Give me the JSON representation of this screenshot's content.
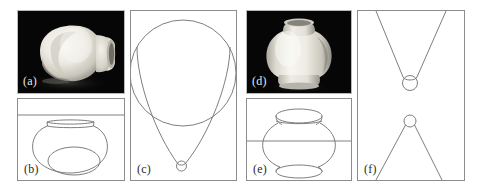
{
  "figure": {
    "background_color": "#ffffff",
    "line_color": "#6f6f6f",
    "photo_background": "#050505",
    "width": 482,
    "height": 189
  },
  "panels": [
    {
      "id": "a",
      "label": "(a)",
      "kind": "photograph",
      "label_color": "#e8e8e8",
      "description": "Greyscale photograph of a ceramic vase viewed obliquely from above, tilted on its side against a black background",
      "box": {
        "x": 17,
        "y": 10,
        "w": 108,
        "h": 84
      }
    },
    {
      "id": "b",
      "label": "(b)",
      "kind": "line-drawing",
      "label_color": "#2a2a2a",
      "description": "Line drawing of the tilted vase: rim ellipse seen nearly edge-on at top, rounded body, and an interior ellipse marking the base; a horizontal reference line crosses the upper part of the panel",
      "has_horizon_line": true,
      "box": {
        "x": 17,
        "y": 98,
        "w": 108,
        "h": 83
      }
    },
    {
      "id": "c",
      "label": "(c)",
      "kind": "construction",
      "label_color": "#2a2a2a",
      "description": "Projective construction for the tilted vase: a large circle clipped by the top of the frame, with two long tangent curves converging downward to a small circle at the bottom vertex",
      "elements": [
        "large-circle",
        "left-tangent-curve",
        "right-tangent-curve",
        "small-circle-at-vertex"
      ],
      "box": {
        "x": 130,
        "y": 10,
        "w": 107,
        "h": 171
      }
    },
    {
      "id": "d",
      "label": "(d)",
      "kind": "photograph",
      "label_color": "#e8e8e8",
      "description": "Greyscale photograph of the same ceramic vase standing upright against a black background",
      "box": {
        "x": 246,
        "y": 10,
        "w": 106,
        "h": 84
      }
    },
    {
      "id": "e",
      "label": "(e)",
      "kind": "line-drawing",
      "label_color": "#2a2a2a",
      "description": "Line drawing of the upright vase: open rim ellipse at the top, bulbous body, flared foot ellipse at the bottom; a horizontal reference line passes through the widest part",
      "has_horizon_line": true,
      "box": {
        "x": 246,
        "y": 98,
        "w": 106,
        "h": 83
      }
    },
    {
      "id": "f",
      "label": "(f)",
      "kind": "construction",
      "label_color": "#2a2a2a",
      "description": "Projective construction for the upright vase: an inverted V of two straight lines closing on a circle at the lower vertex in the upper half, and an upright cone of two straight lines meeting a small circle at the apex in the lower half",
      "elements": [
        "upper-inverted-v",
        "upper-circle-at-vertex",
        "lower-cone",
        "lower-circle-at-apex"
      ],
      "box": {
        "x": 357,
        "y": 10,
        "w": 108,
        "h": 171
      }
    }
  ]
}
